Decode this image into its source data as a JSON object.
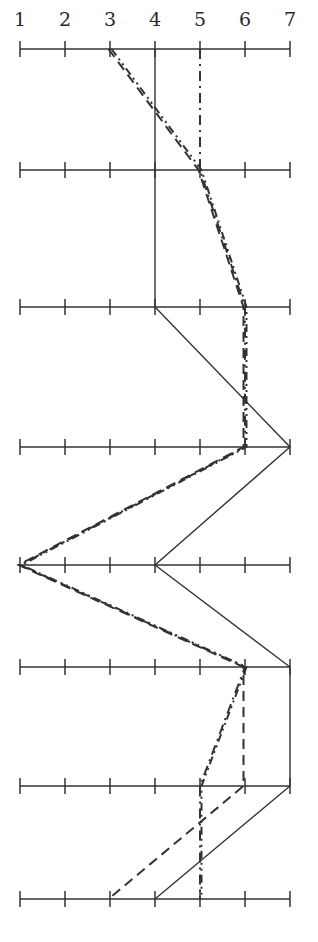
{
  "chart_data": {
    "type": "line",
    "title": "",
    "xlabel": "",
    "ylabel": "",
    "orientation": "profile (vertical rows, horizontal scales)",
    "scale_ticks": [
      "1",
      "2",
      "3",
      "4",
      "5",
      "6",
      "7"
    ],
    "xlim": [
      1,
      7
    ],
    "rows": [
      1,
      2,
      3,
      4,
      5,
      6,
      7,
      8
    ],
    "grid": false,
    "legend": null,
    "series": [
      {
        "name": "solid",
        "style": "solid",
        "values": [
          4,
          4,
          4,
          7,
          4,
          7,
          7,
          4
        ]
      },
      {
        "name": "dashed",
        "style": "dashed",
        "values": [
          3,
          5,
          6,
          6,
          1,
          6,
          6,
          3
        ]
      },
      {
        "name": "dash-dot-dot",
        "style": "dash-dot-dot",
        "values": [
          3,
          5,
          6,
          6,
          1,
          6,
          5,
          5
        ]
      },
      {
        "name": "dash-dot",
        "style": "dash-dot",
        "values": [
          5,
          5,
          6,
          6,
          1,
          6,
          5,
          5
        ]
      }
    ]
  },
  "colors": {
    "ink": "#333333",
    "background": "#ffffff"
  }
}
